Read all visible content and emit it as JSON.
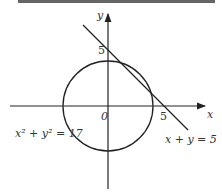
{
  "diagram": {
    "axes": {
      "x_label": "x",
      "y_label": "y",
      "origin_label": "0",
      "x_tick_label": "5",
      "y_tick_label": "5"
    },
    "circle": {
      "equation_label": "x² + y² = 17",
      "radius_squared": 17
    },
    "line": {
      "equation_label": "x + y = 5",
      "x_intercept": 5,
      "y_intercept": 5
    },
    "colors": {
      "stroke": "#222222",
      "top_bar": "#666666"
    }
  }
}
